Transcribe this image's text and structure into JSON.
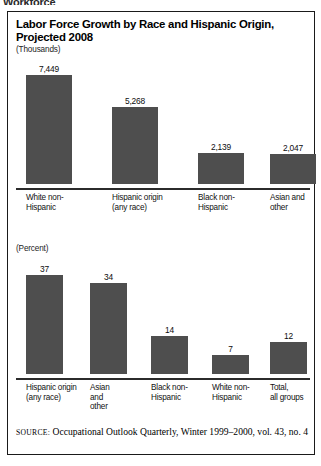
{
  "page": {
    "clipped_heading_fragment": "Workforce"
  },
  "figure": {
    "title": "Labor Force Growth by Race and Hispanic Origin, Projected 2008",
    "source_prefix": "SOURCE:",
    "source_text": " Occupational Outlook Quarterly, Winter 1999–2000, vol. 43, no. 4",
    "bar_color": "#4e4e4e",
    "axis_color": "#2b2b2b",
    "border_color": "#1a1a1a"
  },
  "chart_data": [
    {
      "type": "bar",
      "title": "Labor Force Growth by Race and Hispanic Origin, Projected 2008",
      "unit_label": "(Thousands)",
      "categories": [
        "White non-Hispanic",
        "Hispanic origin (any race)",
        "Black non-Hispanic",
        "Asian and other"
      ],
      "category_lines": [
        [
          "White non-",
          "Hispanic"
        ],
        [
          "Hispanic origin",
          "(any race)"
        ],
        [
          "Black non-",
          "Hispanic"
        ],
        [
          "Asian and",
          "other"
        ]
      ],
      "values": [
        7449,
        5268,
        2139,
        2047
      ],
      "value_labels": [
        "7,449",
        "5,268",
        "2,139",
        "2,047"
      ],
      "xlabel": "",
      "ylabel": "Thousands",
      "ylim": [
        0,
        8200
      ],
      "grid": false,
      "legend": "none"
    },
    {
      "type": "bar",
      "title": "",
      "unit_label": "(Percent)",
      "categories": [
        "Hispanic origin (any race)",
        "Asian and other",
        "Black non-Hispanic",
        "White non-Hispanic",
        "Total, all groups"
      ],
      "category_lines": [
        [
          "Hispanic origin",
          "(any race)"
        ],
        [
          "Asian",
          "and",
          "other"
        ],
        [
          "Black non-",
          "Hispanic"
        ],
        [
          "White non-",
          "Hispanic"
        ],
        [
          "Total,",
          "all groups"
        ]
      ],
      "values": [
        37,
        34,
        14,
        7,
        12
      ],
      "value_labels": [
        "37",
        "34",
        "14",
        "7",
        "12"
      ],
      "xlabel": "",
      "ylabel": "Percent",
      "ylim": [
        0,
        41
      ],
      "grid": false,
      "legend": "none"
    }
  ]
}
